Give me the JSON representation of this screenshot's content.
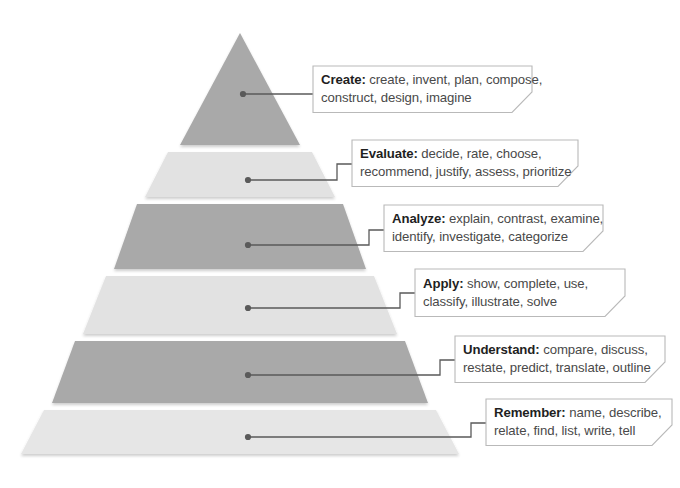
{
  "diagram": {
    "shape": "pyramid",
    "level_count": 6,
    "colors": {
      "band_dark": "#a9a9a9",
      "band_dark_alt": "#b2b2b2",
      "band_light": "#e2e2e2",
      "band_light_alt": "#e6e6e6",
      "callout_border": "#b9b9b9",
      "callout_background": "#ffffff",
      "connector": "#5a5a5a",
      "text_term": "#1f1f1f",
      "text_verbs": "#494949",
      "page_background": "#ffffff"
    }
  },
  "levels": [
    {
      "rank": 6,
      "position": "top",
      "term": "Create:",
      "verbs_line1": "create, invent, plan, compose,",
      "verbs_line2": "construct, design, imagine",
      "fill": "#a9a9a9",
      "tone": "dark"
    },
    {
      "rank": 5,
      "position": "second",
      "term": "Evaluate:",
      "verbs_line1": "decide, rate, choose,",
      "verbs_line2": "recommend, justify, assess, prioritize",
      "fill": "#e2e2e2",
      "tone": "light"
    },
    {
      "rank": 4,
      "position": "third",
      "term": "Analyze:",
      "verbs_line1": "explain, contrast, examine,",
      "verbs_line2": "identify, investigate, categorize",
      "fill": "#a9a9a9",
      "tone": "dark"
    },
    {
      "rank": 3,
      "position": "fourth",
      "term": "Apply:",
      "verbs_line1": "show, complete, use,",
      "verbs_line2": "classify, illustrate, solve",
      "fill": "#e2e2e2",
      "tone": "light"
    },
    {
      "rank": 2,
      "position": "fifth",
      "term": "Understand:",
      "verbs_line1": "compare, discuss,",
      "verbs_line2": "restate, predict, translate, outline",
      "fill": "#a9a9a9",
      "tone": "dark"
    },
    {
      "rank": 1,
      "position": "bottom",
      "term": "Remember:",
      "verbs_line1": "name, describe,",
      "verbs_line2": "relate, find, list, write, tell",
      "fill": "#e6e6e6",
      "tone": "light"
    }
  ]
}
